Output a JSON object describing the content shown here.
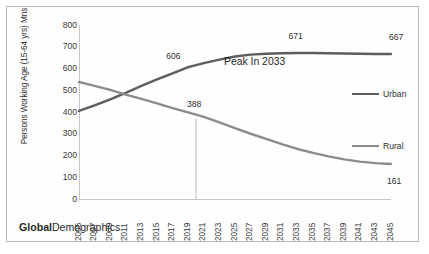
{
  "branding": {
    "bold_part": "Global",
    "regular_part": "Demographics"
  },
  "chart_data": {
    "type": "line",
    "title": "",
    "xlabel": "",
    "ylabel": "Persons Working Age (15-64 yrs)  Mns",
    "ylim": [
      0,
      800
    ],
    "ytick_step": 100,
    "ytick_labels": [
      "800",
      "700",
      "600",
      "500",
      "400",
      "300",
      "200",
      "100",
      "0"
    ],
    "grid": false,
    "legend_position": "right",
    "xlim": [
      2005,
      2045
    ],
    "categories": [
      2005,
      2007,
      2009,
      2011,
      2013,
      2015,
      2017,
      2019,
      2021,
      2023,
      2025,
      2027,
      2029,
      2031,
      2033,
      2035,
      2037,
      2039,
      2041,
      2043,
      2045
    ],
    "tick_labels": [
      "2005",
      "2007",
      "2009",
      "2011",
      "2013",
      "2015",
      "2017",
      "2019",
      "2021",
      "2023",
      "2025",
      "2027",
      "2029",
      "2031",
      "2033",
      "2035",
      "2037",
      "2039",
      "2041",
      "2043",
      "2045"
    ],
    "series": [
      {
        "name": "Urban",
        "color": "#5d5d5d",
        "x": [
          2005,
          2007,
          2009,
          2011,
          2013,
          2015,
          2017,
          2019,
          2021,
          2023,
          2025,
          2027,
          2029,
          2031,
          2033,
          2035,
          2037,
          2039,
          2041,
          2043,
          2045
        ],
        "values": [
          405,
          430,
          458,
          488,
          520,
          550,
          578,
          606,
          625,
          641,
          655,
          664,
          668,
          670,
          671,
          671,
          670,
          669,
          668,
          667,
          667
        ]
      },
      {
        "name": "Rural",
        "color": "#8c8c8c",
        "x": [
          2005,
          2007,
          2009,
          2011,
          2013,
          2015,
          2017,
          2019,
          2021,
          2023,
          2025,
          2027,
          2029,
          2031,
          2033,
          2035,
          2037,
          2039,
          2041,
          2043,
          2045
        ],
        "values": [
          538,
          520,
          502,
          480,
          460,
          440,
          418,
          398,
          378,
          352,
          326,
          300,
          276,
          252,
          230,
          212,
          196,
          182,
          172,
          165,
          161
        ]
      }
    ],
    "data_labels": [
      {
        "text": "606",
        "series": "Urban",
        "x": 2019,
        "y": 606
      },
      {
        "text": "671",
        "series": "Urban",
        "x": 2033,
        "y": 671
      },
      {
        "text": "667",
        "series": "Urban",
        "x": 2045,
        "y": 667
      },
      {
        "text": "388",
        "series": "Rural",
        "x": 2020,
        "y": 388
      },
      {
        "text": "161",
        "series": "Rural",
        "x": 2045,
        "y": 161
      }
    ],
    "annotations": [
      {
        "text": "Peak In 2033",
        "x": 2030,
        "y": 630
      }
    ],
    "legend_entries": [
      {
        "label": "Urban",
        "color": "#5d5d5d"
      },
      {
        "label": "Rural",
        "color": "#8c8c8c"
      }
    ]
  }
}
